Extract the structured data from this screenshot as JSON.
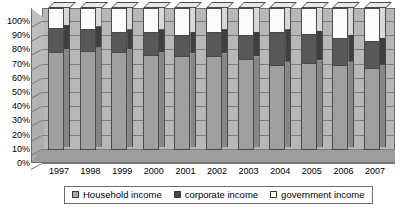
{
  "chart_data": {
    "type": "bar",
    "subtype": "stacked-100-percent-3d",
    "title": "",
    "xlabel": "",
    "ylabel": "",
    "ylim": [
      0,
      100
    ],
    "ytick_labels": [
      "100%",
      "90%",
      "80%",
      "70%",
      "60%",
      "50%",
      "40%",
      "30%",
      "20%",
      "10%",
      "0%"
    ],
    "ytick_values": [
      100,
      90,
      80,
      70,
      60,
      50,
      40,
      30,
      20,
      10,
      0
    ],
    "grid": true,
    "legend_position": "bottom",
    "categories": [
      "1997",
      "1998",
      "1999",
      "2000",
      "2001",
      "2002",
      "2003",
      "2004",
      "2005",
      "2006",
      "2007"
    ],
    "series": [
      {
        "name": "Household income",
        "color": "#a0a0a0",
        "values": [
          69,
          70,
          69,
          67,
          66,
          66,
          64,
          60,
          61,
          60,
          58
        ]
      },
      {
        "name": "corporate income",
        "color": "#585858",
        "values": [
          17,
          15,
          14,
          16,
          15,
          17,
          17,
          23,
          21,
          19,
          19
        ]
      },
      {
        "name": "government income",
        "color": "#ffffff",
        "values": [
          14,
          15,
          17,
          17,
          19,
          17,
          19,
          17,
          18,
          21,
          23
        ]
      }
    ]
  },
  "legend": {
    "items": [
      {
        "label": "Household income",
        "swatch": "sw-household"
      },
      {
        "label": "corporate income",
        "swatch": "sw-corporate"
      },
      {
        "label": "government income",
        "swatch": "sw-government"
      }
    ]
  },
  "colors": {
    "household": "#a0a0a0",
    "corporate": "#585858",
    "government": "#ffffff",
    "plot_background": "#b7b7b7",
    "floor": "#9d9d9d",
    "gridline": "#7d7d7d",
    "border": "#6d6d6d"
  }
}
